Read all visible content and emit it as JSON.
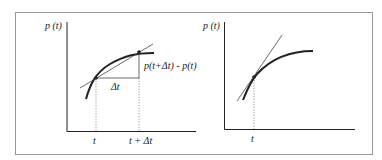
{
  "figure": {
    "left_panel": {
      "y_axis_label": "p (t)",
      "delta_t_label": "Δt",
      "difference_label": "p(t+Δt) - p(t)",
      "x_tick_t": "t",
      "x_tick_t_plus_dt": "t + Δt",
      "description": "Secant line through p(t) and p(t+Δt)"
    },
    "right_panel": {
      "y_axis_label": "p (t)",
      "x_tick_t": "t",
      "description": "Tangent line at p(t)"
    },
    "colors": {
      "frame": "#9a9a9a",
      "ink": "#222222"
    }
  }
}
